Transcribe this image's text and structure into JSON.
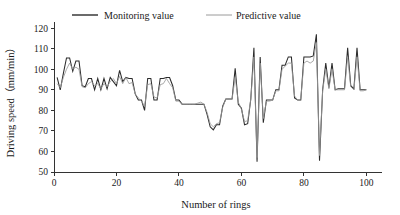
{
  "chart_data": {
    "type": "line",
    "title": "",
    "xlabel": "Number of rings",
    "ylabel": "Driving speed（mm/min）",
    "xlim": [
      0,
      105
    ],
    "ylim": [
      50,
      123
    ],
    "grid": false,
    "legend_position": "top-inside",
    "xticks": [
      0,
      20,
      40,
      60,
      80,
      100
    ],
    "xtick_labels": [
      "0",
      "20",
      "40",
      "60",
      "80",
      "100"
    ],
    "yticks": [
      50,
      60,
      70,
      80,
      90,
      100,
      110,
      120
    ],
    "ytick_labels": [
      "50",
      "60",
      "70",
      "80",
      "90",
      "100",
      "110",
      "120"
    ],
    "x": [
      1,
      2,
      3,
      4,
      5,
      6,
      7,
      8,
      9,
      10,
      11,
      12,
      13,
      14,
      15,
      16,
      17,
      18,
      19,
      20,
      21,
      22,
      23,
      24,
      25,
      26,
      27,
      28,
      29,
      30,
      31,
      32,
      33,
      34,
      35,
      36,
      37,
      38,
      39,
      40,
      41,
      42,
      43,
      44,
      45,
      46,
      47,
      48,
      49,
      50,
      51,
      52,
      53,
      54,
      55,
      56,
      57,
      58,
      59,
      60,
      61,
      62,
      63,
      64,
      65,
      66,
      67,
      68,
      69,
      70,
      71,
      72,
      73,
      74,
      75,
      76,
      77,
      78,
      79,
      80,
      81,
      82,
      83,
      84,
      85,
      86,
      87,
      88,
      89,
      90,
      91,
      92,
      93,
      94,
      95,
      96,
      97,
      98,
      99,
      100
    ],
    "series": [
      {
        "name": "Monitoring value",
        "color": "#2b2b2b",
        "values": [
          96,
          90,
          98,
          105.5,
          105.5,
          99,
          104,
          104,
          92,
          91.5,
          95.5,
          95.5,
          90,
          95.5,
          90,
          95.5,
          90.5,
          96,
          94,
          92,
          99.5,
          94,
          96,
          95.5,
          95.5,
          88,
          85,
          85,
          80,
          95.5,
          95.5,
          85,
          85,
          95.5,
          95.5,
          96,
          96,
          92,
          85,
          85,
          83,
          83,
          83,
          83,
          83,
          83,
          83,
          83,
          78,
          72,
          70.5,
          73,
          73,
          82,
          85.5,
          85.5,
          85.5,
          100.5,
          83,
          81,
          73,
          73.5,
          85.5,
          110.5,
          55,
          106,
          74,
          85,
          85,
          85,
          90,
          90,
          102,
          102,
          106,
          106,
          86,
          85,
          85,
          106,
          106,
          106,
          106.5,
          117,
          55.5,
          90,
          103,
          91,
          103,
          90,
          90.5,
          90.5,
          90.5,
          110.5,
          92,
          90.5,
          110.5,
          90,
          90,
          90
        ]
      },
      {
        "name": "Predictive value",
        "color": "#9a9a9a",
        "values": [
          93,
          91,
          96,
          100,
          103,
          100,
          101,
          100,
          91.5,
          91,
          93,
          94,
          92,
          93,
          90.5,
          93,
          91.5,
          94,
          95.5,
          93,
          96.5,
          93,
          96,
          93,
          93.5,
          88,
          86,
          84.5,
          82,
          92.5,
          93,
          86.5,
          86,
          92.5,
          93,
          95.5,
          93,
          91,
          84.5,
          84.5,
          83,
          83,
          83,
          83,
          83,
          83.5,
          84,
          83,
          79,
          73.5,
          72,
          73.5,
          74,
          81.5,
          85.5,
          85.5,
          85.5,
          96,
          84,
          80.5,
          74.5,
          75,
          85.5,
          106,
          57,
          103,
          76,
          84.5,
          84.5,
          85,
          89.5,
          89.5,
          100,
          101.5,
          103,
          103,
          87,
          85,
          85.5,
          103,
          104,
          103,
          104,
          113,
          58,
          89.5,
          100,
          90.5,
          100,
          90,
          90,
          90,
          90,
          106,
          91.5,
          90,
          106,
          89.5,
          89.5,
          90
        ]
      }
    ]
  },
  "legend": {
    "items": [
      {
        "label": "Monitoring value",
        "color": "#2b2b2b"
      },
      {
        "label": "Predictive value",
        "color": "#9a9a9a"
      }
    ]
  }
}
